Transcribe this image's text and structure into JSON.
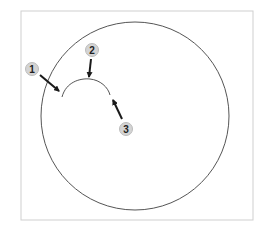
{
  "diagram": {
    "frame": {
      "x": 21,
      "y": 11,
      "width": 232,
      "height": 209,
      "stroke": "#cfcfcf"
    },
    "circle": {
      "cx": 135,
      "cy": 116,
      "r": 94,
      "stroke": "#555555"
    },
    "arc": {
      "path": "M62,97 C66,82 80,78 90,79 C100,80 108,87 110,95",
      "stroke": "#555555"
    },
    "callouts": [
      {
        "label": "1",
        "badge": {
          "cx": 32,
          "cy": 69
        },
        "arrow": {
          "x1": 40,
          "y1": 75,
          "x2": 59,
          "y2": 91
        }
      },
      {
        "label": "2",
        "badge": {
          "cx": 92,
          "cy": 50
        },
        "arrow": {
          "x1": 91,
          "y1": 59,
          "x2": 89,
          "y2": 77
        }
      },
      {
        "label": "3",
        "badge": {
          "cx": 126,
          "cy": 129
        },
        "arrow": {
          "x1": 122,
          "y1": 119,
          "x2": 113,
          "y2": 100
        }
      }
    ],
    "badge_fill": "#d4d4d4",
    "badge_stroke": "#bcbcbc",
    "arrow_color": "#1a1a1a"
  }
}
